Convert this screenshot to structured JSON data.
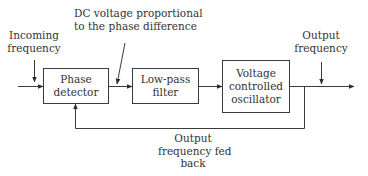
{
  "diagram": {
    "type": "block-diagram",
    "line_color": "#3a3a3a",
    "blocks": [
      {
        "id": "phase-detector",
        "lines": [
          "Phase",
          "detector"
        ]
      },
      {
        "id": "low-pass-filter",
        "lines": [
          "Low-pass",
          "filter"
        ]
      },
      {
        "id": "vco",
        "lines": [
          "Voltage",
          "controlled",
          "oscillator"
        ]
      }
    ],
    "annotations": {
      "incoming": [
        "Incoming",
        "frequency"
      ],
      "dc_voltage": [
        "DC voltage proportional",
        "to the phase difference"
      ],
      "output": [
        "Output",
        "frequency"
      ],
      "feedback": [
        "Output",
        "frequency fed",
        "back"
      ]
    }
  }
}
